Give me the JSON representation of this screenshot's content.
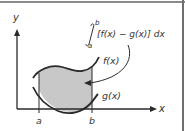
{
  "figure": {
    "type": "area-between-curves",
    "y_axis_label": "y",
    "x_axis_label": "x",
    "upper_curve_label": "f(x)",
    "lower_curve_label": "g(x)",
    "lower_bound_label": "a",
    "upper_bound_label": "b",
    "integral": {
      "upper_limit": "b",
      "lower_limit": "a",
      "integrand": "[f(x) − g(x)] dx"
    },
    "colors": {
      "shaded_region": "#c8c8c8",
      "curves": "#2a2a2a",
      "axes": "#2a2a2a",
      "border": "#6e6e6e"
    }
  }
}
